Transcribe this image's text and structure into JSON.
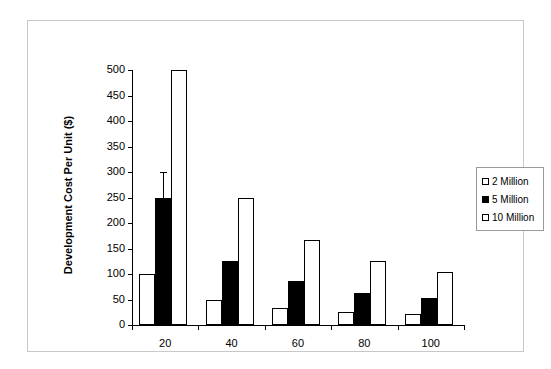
{
  "chart_data": {
    "type": "bar",
    "title": "",
    "subtitle": "",
    "xlabel": "",
    "ylabel": "Development Cost Per Unit ($)",
    "categories": [
      "20",
      "40",
      "60",
      "80",
      "100"
    ],
    "series": [
      {
        "name": "2 Million",
        "color": "#ffffff",
        "values": [
          100,
          50,
          33,
          25,
          21
        ]
      },
      {
        "name": "5 Million",
        "color": "#000000",
        "values": [
          250,
          125,
          87,
          63,
          52
        ]
      },
      {
        "name": "10 Million",
        "color": "#ffffff",
        "values": [
          500,
          250,
          167,
          125,
          103
        ]
      }
    ],
    "ylim": [
      0,
      500
    ],
    "y_ticks": [
      0,
      50,
      100,
      150,
      200,
      250,
      300,
      350,
      400,
      450,
      500
    ],
    "y_tick_labels": [
      "0",
      "50",
      "100",
      "150",
      "200",
      "250",
      "300",
      "350",
      "400",
      "450",
      "500"
    ],
    "grid": false,
    "legend_position": "right",
    "annotations": [
      {
        "kind": "error-bar",
        "series": "5 Million",
        "category": "20",
        "value": 250,
        "upper": 300
      }
    ]
  },
  "legend": {
    "items": [
      {
        "label": "2 Million",
        "swatch": "light"
      },
      {
        "label": "5 Million",
        "swatch": "dark"
      },
      {
        "label": "10 Million",
        "swatch": "light"
      }
    ]
  }
}
